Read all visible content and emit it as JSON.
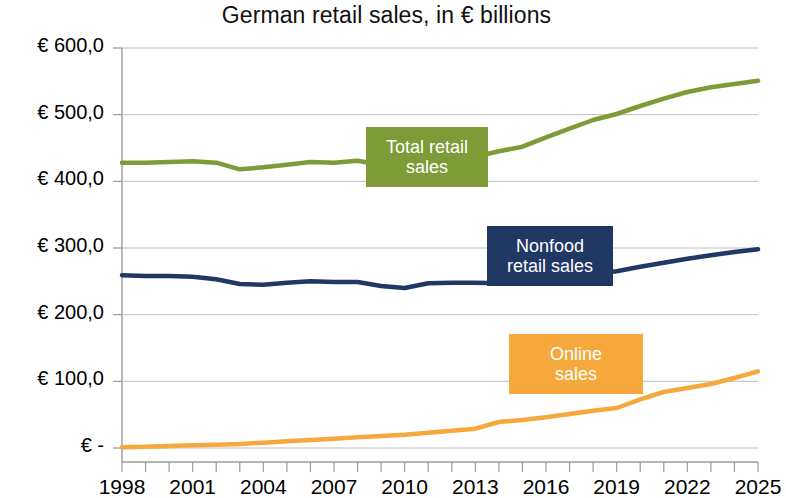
{
  "chart_data": {
    "type": "line",
    "title": "German retail sales, in € billions",
    "xlabel": "",
    "ylabel": "",
    "ylim": [
      0,
      600
    ],
    "xlim": [
      1998,
      2025
    ],
    "grid": true,
    "legend_position": "inline-labels",
    "y_tick_labels": [
      "€ 600,0",
      "€ 500,0",
      "€ 400,0",
      "€ 300,0",
      "€ 200,0",
      "€ 100,0",
      "€ -"
    ],
    "y_tick_values": [
      600,
      500,
      400,
      300,
      200,
      100,
      0
    ],
    "x_tick_labels": [
      "1998",
      "2001",
      "2004",
      "2007",
      "2010",
      "2013",
      "2016",
      "2019",
      "2022",
      "2025"
    ],
    "x_tick_values": [
      1998,
      2001,
      2004,
      2007,
      2010,
      2013,
      2016,
      2019,
      2022,
      2025
    ],
    "x": [
      1998,
      1999,
      2000,
      2001,
      2002,
      2003,
      2004,
      2005,
      2006,
      2007,
      2008,
      2009,
      2010,
      2011,
      2012,
      2013,
      2014,
      2015,
      2016,
      2017,
      2018,
      2019,
      2020,
      2021,
      2022,
      2023,
      2024,
      2025
    ],
    "series": [
      {
        "name": "Total retail sales",
        "color": "#7d9b36",
        "label_text": "Total retail\nsales",
        "values": [
          428,
          428,
          429,
          430,
          428,
          418,
          421,
          425,
          429,
          428,
          431,
          425,
          430,
          437,
          438,
          437,
          445,
          452,
          466,
          479,
          492,
          501,
          513,
          524,
          534,
          541,
          546,
          551
        ]
      },
      {
        "name": "Nonfood retail sales",
        "color": "#1f3864",
        "label_text": "Nonfood\nretail sales",
        "values": [
          259,
          258,
          258,
          257,
          253,
          246,
          245,
          248,
          250,
          249,
          249,
          243,
          240,
          247,
          248,
          248,
          247,
          249,
          253,
          257,
          261,
          265,
          272,
          278,
          284,
          289,
          294,
          298
        ]
      },
      {
        "name": "Online sales",
        "color": "#f5a93c",
        "label_text": "Online\nsales",
        "values": [
          1,
          2,
          3,
          4,
          5,
          6,
          8,
          10,
          12,
          14,
          16,
          18,
          20,
          23,
          26,
          29,
          39,
          42,
          46,
          51,
          56,
          60,
          73,
          84,
          90,
          96,
          105,
          115
        ]
      }
    ]
  }
}
